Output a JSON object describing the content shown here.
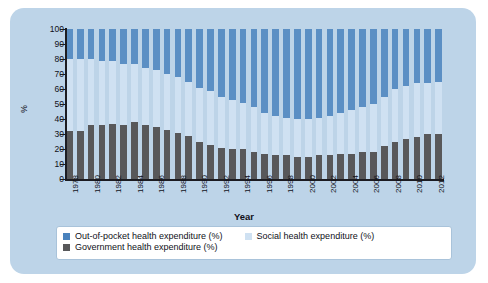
{
  "chart_data": {
    "type": "bar",
    "subtype": "stacked-percent",
    "title": "",
    "xlabel": "Year",
    "ylabel": "%",
    "ylim": [
      0,
      100
    ],
    "ytick_step": 10,
    "yticks": [
      0,
      10,
      20,
      30,
      40,
      50,
      60,
      70,
      80,
      90,
      100
    ],
    "grid": false,
    "legend_position": "bottom",
    "x": [
      1978,
      1979,
      1980,
      1981,
      1982,
      1983,
      1984,
      1985,
      1986,
      1987,
      1988,
      1989,
      1990,
      1991,
      1992,
      1993,
      1994,
      1995,
      1996,
      1997,
      1998,
      1999,
      2000,
      2001,
      2002,
      2003,
      2004,
      2005,
      2006,
      2007,
      2008,
      2009,
      2010,
      2011,
      2012
    ],
    "xtick_labels": [
      "1978",
      "1980",
      "1982",
      "1984",
      "1986",
      "1988",
      "1990",
      "1992",
      "1994",
      "1996",
      "1998",
      "2000",
      "2002",
      "2004",
      "2006",
      "2008",
      "2010",
      "2012"
    ],
    "series": [
      {
        "name": "Government health expenditure (%)",
        "color": "#58585a",
        "values": [
          32,
          32,
          36,
          36,
          37,
          36,
          38,
          36,
          35,
          33,
          31,
          29,
          25,
          23,
          21,
          20,
          20,
          18,
          17,
          16,
          16,
          15,
          15,
          16,
          16,
          17,
          17,
          18,
          18,
          22,
          25,
          27,
          28,
          30,
          30
        ]
      },
      {
        "name": "Social health expenditure (%)",
        "color": "#cfe1f2",
        "values": [
          48,
          48,
          44,
          43,
          42,
          41,
          39,
          38,
          38,
          37,
          37,
          36,
          36,
          36,
          34,
          33,
          31,
          30,
          27,
          26,
          25,
          25,
          25,
          25,
          26,
          27,
          29,
          30,
          32,
          33,
          35,
          35,
          36,
          34,
          35
        ]
      },
      {
        "name": "Out-of-pocket health expenditure (%)",
        "color": "#5b8fc4",
        "values": [
          20,
          20,
          20,
          21,
          21,
          23,
          23,
          26,
          27,
          30,
          32,
          35,
          39,
          41,
          45,
          47,
          49,
          52,
          56,
          58,
          59,
          60,
          60,
          59,
          58,
          56,
          54,
          52,
          50,
          45,
          40,
          38,
          36,
          36,
          35
        ]
      }
    ]
  },
  "legend": {
    "items": [
      {
        "label": "Out-of-pocket health expenditure (%)",
        "color": "#4a82bd"
      },
      {
        "label": "Social health expenditure (%)",
        "color": "#cfe1f2"
      },
      {
        "label": "Government health expenditure (%)",
        "color": "#58585a"
      }
    ]
  }
}
